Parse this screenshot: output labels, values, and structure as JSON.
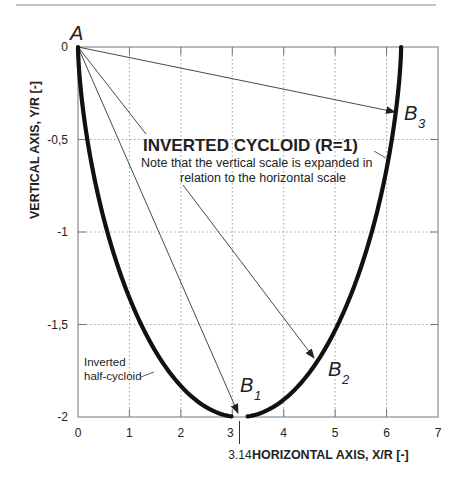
{
  "chart_data": {
    "type": "line",
    "title": "INVERTED CYCLOID (R=1)",
    "subtitle": "Note that the vertical scale is expanded in relation to the horizontal scale",
    "xlabel": "HORIZONTAL AXIS, X/R [-]",
    "ylabel": "VERTICAL AXIS, Y/R [-]",
    "xlim": [
      0,
      7
    ],
    "ylim": [
      -2,
      0
    ],
    "x_ticks": [
      "0",
      "1",
      "2",
      "3",
      "4",
      "5",
      "6",
      "7"
    ],
    "y_ticks": [
      "0",
      "-0,5",
      "-1",
      "-1,5",
      "-2"
    ],
    "grid": true,
    "special_x_marker": {
      "x": 3.14,
      "label": "3.14"
    },
    "series": [
      {
        "name": "Inverted half-cycloid",
        "equation": "x = t - sin(t), y = -(1 - cos(t)), t in [0, 2π]",
        "x": [
          0,
          0.02,
          0.14,
          0.45,
          0.98,
          1.71,
          2.56,
          3.14,
          3.72,
          4.57,
          5.3,
          5.83,
          6.14,
          6.26,
          6.28
        ],
        "y": [
          0,
          -0.12,
          -0.46,
          -0.95,
          -1.42,
          -1.8,
          -1.99,
          -2.0,
          -1.99,
          -1.8,
          -1.42,
          -0.95,
          -0.46,
          -0.12,
          0
        ]
      }
    ],
    "points": [
      {
        "name": "A",
        "x": 0,
        "y": 0
      },
      {
        "name": "B1",
        "label": "B",
        "sub": "1",
        "x": 3.14,
        "y": -2.0
      },
      {
        "name": "B2",
        "label": "B",
        "sub": "2",
        "x": 4.6,
        "y": -1.68
      },
      {
        "name": "B3",
        "label": "B",
        "sub": "3",
        "x": 6.1,
        "y": -0.35
      }
    ],
    "arrows": [
      {
        "from": "A",
        "to": "B1"
      },
      {
        "from": "A",
        "to": "B2"
      },
      {
        "from": "A",
        "to": "B3"
      }
    ],
    "annotations": [
      {
        "text_lines": [
          "Inverted",
          "half-cycloid"
        ],
        "points_to": "cycloid left branch"
      }
    ]
  },
  "labels": {
    "point_a": "A",
    "b": "B",
    "b1_sub": "1",
    "b2_sub": "2",
    "b3_sub": "3",
    "annotation_line1": "Inverted",
    "annotation_line2": "half-cycloid",
    "note_line1": "Note that the vertical scale is expanded in",
    "note_line2": "relation to the horizontal scale"
  }
}
